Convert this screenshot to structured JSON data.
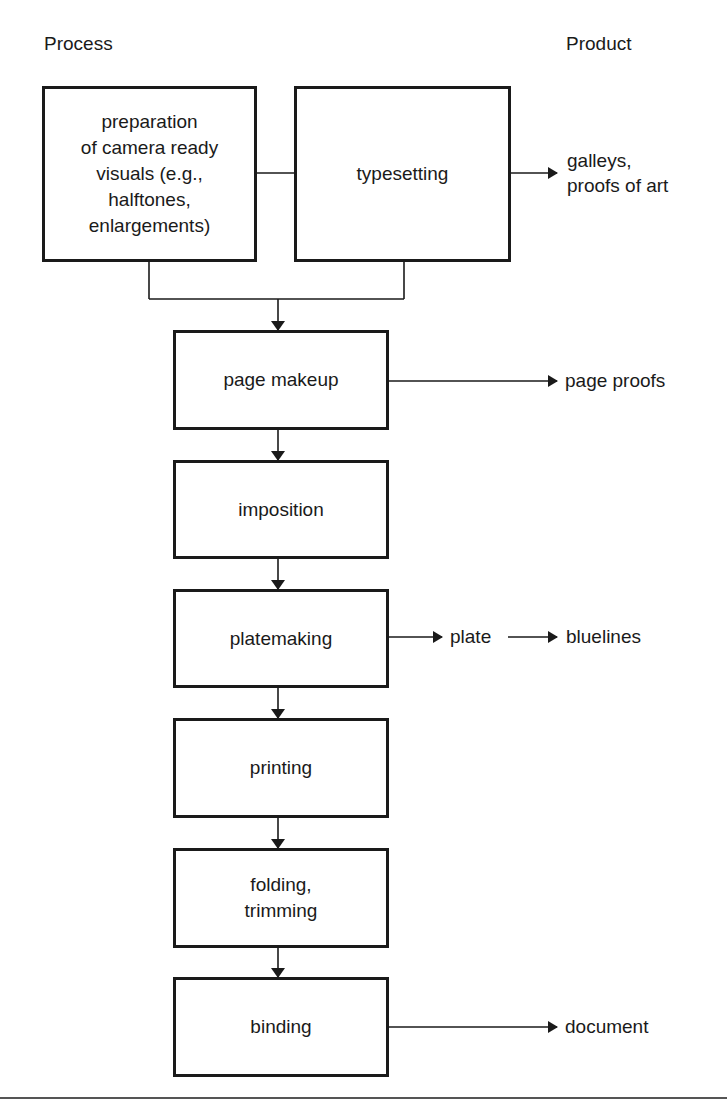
{
  "headers": {
    "process": "Process",
    "product": "Product"
  },
  "process_steps": [
    {
      "id": "prep",
      "lines": [
        "preparation",
        "of camera ready",
        "visuals (e.g.,",
        "halftones,",
        "enlargements)"
      ]
    },
    {
      "id": "typesetting",
      "lines": [
        "typesetting"
      ]
    },
    {
      "id": "page_makeup",
      "lines": [
        "page makeup"
      ]
    },
    {
      "id": "imposition",
      "lines": [
        "imposition"
      ]
    },
    {
      "id": "platemaking",
      "lines": [
        "platemaking"
      ]
    },
    {
      "id": "printing",
      "lines": [
        "printing"
      ]
    },
    {
      "id": "folding",
      "lines": [
        "folding,",
        "trimming"
      ]
    },
    {
      "id": "binding",
      "lines": [
        "binding"
      ]
    }
  ],
  "products": {
    "typesetting": [
      "galleys,",
      "proofs of art"
    ],
    "page_makeup": [
      "page proofs"
    ],
    "platemaking_intermediate": [
      "plate"
    ],
    "platemaking": [
      "bluelines"
    ],
    "binding": [
      "document"
    ]
  },
  "edges": [
    {
      "from": "prep",
      "to": "typesetting",
      "type": "line"
    },
    {
      "from": "prep",
      "to": "page_makeup",
      "type": "arrow"
    },
    {
      "from": "typesetting",
      "to": "page_makeup",
      "type": "arrow"
    },
    {
      "from": "typesetting",
      "to": "galleys, proofs of art",
      "type": "arrow"
    },
    {
      "from": "page_makeup",
      "to": "imposition",
      "type": "arrow"
    },
    {
      "from": "page_makeup",
      "to": "page proofs",
      "type": "arrow"
    },
    {
      "from": "imposition",
      "to": "platemaking",
      "type": "arrow"
    },
    {
      "from": "platemaking",
      "to": "plate",
      "type": "arrow"
    },
    {
      "from": "plate",
      "to": "bluelines",
      "type": "arrow"
    },
    {
      "from": "platemaking",
      "to": "printing",
      "type": "arrow"
    },
    {
      "from": "printing",
      "to": "folding",
      "type": "arrow"
    },
    {
      "from": "folding",
      "to": "binding",
      "type": "arrow"
    },
    {
      "from": "binding",
      "to": "document",
      "type": "arrow"
    }
  ],
  "colors": {
    "stroke": "#1a1a1a",
    "background": "#ffffff"
  }
}
